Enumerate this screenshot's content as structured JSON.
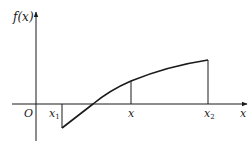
{
  "diagram": {
    "type": "function-graph",
    "y_axis_label": "f(x)",
    "x_axis_label": "x",
    "origin_label": "O",
    "points": [
      {
        "name": "x1",
        "label": "x",
        "subscript": "1"
      },
      {
        "name": "x",
        "label": "x",
        "subscript": ""
      },
      {
        "name": "x2",
        "label": "x",
        "subscript": "2"
      }
    ],
    "curve_description": "Increasing concave curve starting below the x-axis at x1, crossing the axis, rising to its end at x2",
    "colors": {
      "stroke": "#1a1a1a",
      "background": "#ffffff"
    }
  }
}
